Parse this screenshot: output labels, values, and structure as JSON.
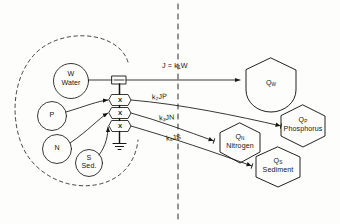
{
  "diagram": {
    "ink_color": "#17150f",
    "paper_color": "#fdfdfc",
    "boundary": {
      "system_envelope_name": "dashed-system-boundary",
      "divider_name": "vertical-dashed-divider"
    },
    "sources": [
      {
        "id": "W",
        "symbol": "W",
        "label": "Water",
        "cx": 71,
        "cy": 81,
        "r": 17.5
      },
      {
        "id": "P",
        "symbol": "P",
        "label": "",
        "cx": 52,
        "cy": 116,
        "r": 14.5
      },
      {
        "id": "N",
        "symbol": "N",
        "label": "",
        "cx": 57,
        "cy": 149,
        "r": 14.5
      },
      {
        "id": "S",
        "symbol": "S",
        "label": "Sed.",
        "cx": 89,
        "cy": 163,
        "r": 13.5
      }
    ],
    "multipliers": [
      {
        "id": "X1",
        "symbol": "X",
        "cx": 120,
        "cy": 100
      },
      {
        "id": "X2",
        "symbol": "X",
        "cx": 120,
        "cy": 113
      },
      {
        "id": "X3",
        "symbol": "X",
        "cx": 120,
        "cy": 126
      }
    ],
    "sensor": {
      "id": "flow-sensor",
      "x": 112,
      "y": 76,
      "w": 14,
      "h": 8
    },
    "ground": {
      "id": "ground-symbol",
      "x": 120,
      "y": 146
    },
    "fluxes": [
      {
        "id": "J",
        "text": "J = k",
        "sub": "1",
        "tail": "W",
        "x": 162,
        "y": 62
      },
      {
        "id": "k2",
        "text": "k",
        "sub": "2",
        "tail": "JP",
        "x": 152,
        "y": 93
      },
      {
        "id": "k3",
        "text": "k",
        "sub": "3",
        "tail": "JN",
        "x": 159,
        "y": 114
      },
      {
        "id": "k4",
        "text": "k",
        "sub": "4",
        "tail": "JS",
        "x": 166,
        "y": 134
      }
    ],
    "tanks": [
      {
        "id": "QW",
        "symbol": "Q",
        "sub": "W",
        "label": "",
        "cx": 271,
        "cy": 84,
        "w": 54,
        "h": 52
      },
      {
        "id": "QP",
        "symbol": "Q",
        "sub": "P",
        "label": "Phosphorus",
        "cx": 303,
        "cy": 126,
        "w": 52,
        "h": 42
      },
      {
        "id": "QN",
        "symbol": "Q",
        "sub": "N",
        "label": "Nitrogen",
        "cx": 240,
        "cy": 143,
        "w": 46,
        "h": 40
      },
      {
        "id": "QS",
        "symbol": "Q",
        "sub": "S",
        "label": "Sediment",
        "cx": 278,
        "cy": 167,
        "w": 48,
        "h": 40
      }
    ]
  }
}
